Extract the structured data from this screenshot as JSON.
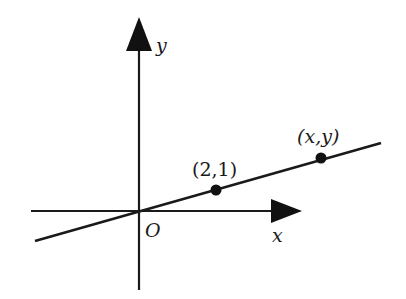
{
  "diagram": {
    "type": "coordinate-plane-line-through-origin",
    "axes": {
      "x_label": "x",
      "y_label": "y",
      "origin_label": "O"
    },
    "points": [
      {
        "label": "(2,1)",
        "name": "point-2-1"
      },
      {
        "label": "(x,y)",
        "name": "point-x-y"
      }
    ],
    "colors": {
      "ink": "#1a1a1a",
      "background": "#ffffff"
    }
  }
}
